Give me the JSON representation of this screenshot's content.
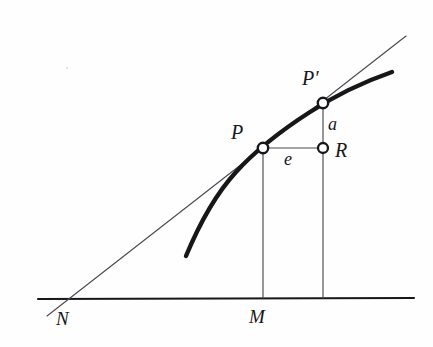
{
  "figure": {
    "kind": "geometry-diagram",
    "background_color": "#fefefe",
    "ink_color": "#17171a",
    "thin_line_color": "#4a4a52"
  },
  "labels": {
    "point_P": "P",
    "point_P_prime": "P′",
    "point_R": "R",
    "segment_a": "a",
    "segment_e": "e",
    "foot_M": "M",
    "intercept_N": "N"
  },
  "geometry": {
    "baseline": {
      "x1": 38,
      "y1": 299,
      "x2": 414,
      "y2": 298
    },
    "tangent_line": {
      "x1": 47,
      "y1": 316,
      "x2": 406,
      "y2": 36
    },
    "curve_path": "M 186 256 C 196 232 214 196 236 172 C 256 150 282 130 310 112 C 336 95 366 81 392 72",
    "points": [
      {
        "name": "P",
        "x": 263,
        "y": 148,
        "marker": "open-circle"
      },
      {
        "name": "P′",
        "x": 323,
        "y": 103,
        "marker": "open-circle"
      },
      {
        "name": "R",
        "x": 323,
        "y": 148,
        "marker": "open-circle"
      }
    ],
    "segments": [
      {
        "name": "run-e",
        "x1": 263,
        "y1": 148,
        "x2": 323,
        "y2": 148
      },
      {
        "name": "rise-a",
        "x1": 323,
        "y1": 103,
        "x2": 323,
        "y2": 148
      },
      {
        "name": "ordinate-PM",
        "x1": 263,
        "y1": 148,
        "x2": 263,
        "y2": 298
      },
      {
        "name": "ordinate-R",
        "x1": 323,
        "y1": 148,
        "x2": 323,
        "y2": 298
      }
    ],
    "baseline_feet": [
      {
        "name": "M",
        "x": 263,
        "y": 298
      },
      {
        "name": "N",
        "x": 62,
        "y": 299
      }
    ]
  }
}
